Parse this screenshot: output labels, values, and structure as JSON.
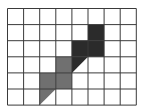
{
  "grid": {
    "columns": 8,
    "rows": 6,
    "cell_size": 16.1,
    "line_color": "#3a3a3a",
    "background": "#ffffff"
  },
  "colors": {
    "dark": "#2b2b2b",
    "medium": "#707070"
  },
  "shaded_cells": [
    {
      "col": 5,
      "row": 1,
      "shade": "dark",
      "shape": "full"
    },
    {
      "col": 4,
      "row": 2,
      "shade": "dark",
      "shape": "full"
    },
    {
      "col": 5,
      "row": 2,
      "shade": "dark",
      "shape": "full"
    },
    {
      "col": 4,
      "row": 3,
      "shade": "dark",
      "shape": "triangle-upper-left"
    },
    {
      "col": 3,
      "row": 3,
      "shade": "medium",
      "shape": "full"
    },
    {
      "col": 2,
      "row": 4,
      "shade": "medium",
      "shape": "full"
    },
    {
      "col": 3,
      "row": 4,
      "shade": "medium",
      "shape": "full"
    },
    {
      "col": 2,
      "row": 5,
      "shade": "medium",
      "shape": "triangle-upper-left"
    }
  ]
}
